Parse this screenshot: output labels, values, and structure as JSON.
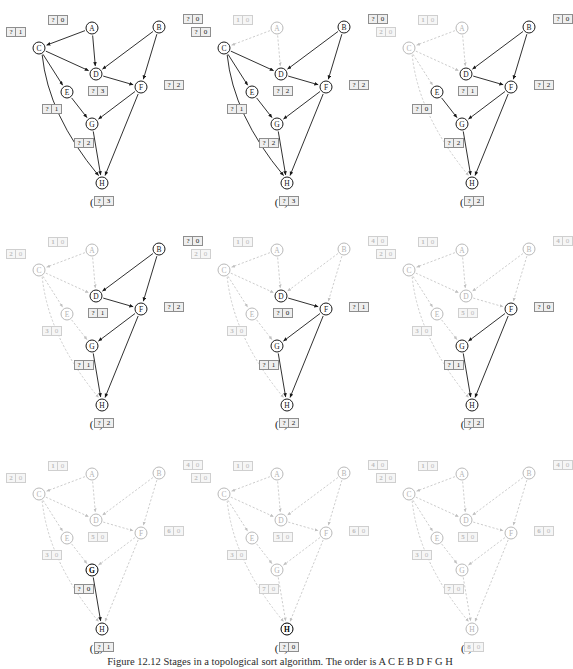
{
  "figure": {
    "caption": "Figure 12.12   Stages in a topological sort algorithm. The order is A C E B D F G H",
    "node_ids": [
      "A",
      "B",
      "C",
      "D",
      "E",
      "F",
      "G",
      "H"
    ],
    "legend": {
      "cell_left_meaning": "topological order number",
      "cell_right_meaning": "remaining in-degree",
      "unknown_symbol": "?"
    },
    "graph": {
      "nodes": [
        {
          "id": "A",
          "x": 88,
          "y": 28
        },
        {
          "id": "B",
          "x": 155,
          "y": 27
        },
        {
          "id": "C",
          "x": 35,
          "y": 48
        },
        {
          "id": "D",
          "x": 92,
          "y": 74
        },
        {
          "id": "E",
          "x": 63,
          "y": 92
        },
        {
          "id": "F",
          "x": 137,
          "y": 87
        },
        {
          "id": "G",
          "x": 88,
          "y": 124
        },
        {
          "id": "H",
          "x": 98,
          "y": 183
        }
      ],
      "edges": [
        {
          "from": "A",
          "to": "C"
        },
        {
          "from": "A",
          "to": "D"
        },
        {
          "from": "B",
          "to": "D"
        },
        {
          "from": "B",
          "to": "F"
        },
        {
          "from": "C",
          "to": "D"
        },
        {
          "from": "C",
          "to": "E"
        },
        {
          "from": "C",
          "to": "H",
          "curved": true
        },
        {
          "from": "D",
          "to": "F"
        },
        {
          "from": "E",
          "to": "G"
        },
        {
          "from": "F",
          "to": "G"
        },
        {
          "from": "F",
          "to": "H"
        },
        {
          "from": "G",
          "to": "H"
        }
      ]
    },
    "label_offsets": {
      "A": {
        "dx": -34,
        "dy": -8
      },
      "B": {
        "dx": 34,
        "dy": -8
      },
      "C": {
        "dx": -23,
        "dy": -16
      },
      "D": {
        "dx": 2,
        "dy": 17
      },
      "E": {
        "dx": -15,
        "dy": 17
      },
      "F": {
        "dx": 33,
        "dy": -2
      },
      "G": {
        "dx": -8,
        "dy": 19
      },
      "H": {
        "dx": 2,
        "dy": 18
      }
    },
    "panels": [
      {
        "id": "a",
        "caption": "(a)",
        "active_nodes": [
          "A",
          "B",
          "C",
          "D",
          "E",
          "F",
          "G",
          "H"
        ],
        "done_nodes": [],
        "highlight": [],
        "labels": {
          "A": {
            "order": "?",
            "indeg": "0"
          },
          "B": {
            "order": "?",
            "indeg": "0"
          },
          "C": {
            "order": "?",
            "indeg": "1"
          },
          "D": {
            "order": "?",
            "indeg": "3"
          },
          "E": {
            "order": "?",
            "indeg": "1"
          },
          "F": {
            "order": "?",
            "indeg": "2"
          },
          "G": {
            "order": "?",
            "indeg": "2"
          },
          "H": {
            "order": "?",
            "indeg": "3"
          }
        },
        "done_edges": []
      },
      {
        "id": "b",
        "caption": "(b)",
        "active_nodes": [
          "B",
          "C",
          "D",
          "E",
          "F",
          "G",
          "H"
        ],
        "done_nodes": [
          "A"
        ],
        "highlight": [],
        "labels": {
          "A": {
            "order": "1",
            "indeg": "0",
            "resolved": true
          },
          "B": {
            "order": "?",
            "indeg": "0"
          },
          "C": {
            "order": "?",
            "indeg": "0"
          },
          "D": {
            "order": "?",
            "indeg": "2"
          },
          "E": {
            "order": "?",
            "indeg": "1"
          },
          "F": {
            "order": "?",
            "indeg": "2"
          },
          "G": {
            "order": "?",
            "indeg": "2"
          },
          "H": {
            "order": "?",
            "indeg": "3"
          }
        },
        "done_edges": [
          "A-C",
          "A-D"
        ]
      },
      {
        "id": "c",
        "caption": "(c)",
        "active_nodes": [
          "B",
          "D",
          "E",
          "F",
          "G",
          "H"
        ],
        "done_nodes": [
          "A",
          "C"
        ],
        "highlight": [],
        "labels": {
          "A": {
            "order": "1",
            "indeg": "0",
            "resolved": true
          },
          "B": {
            "order": "?",
            "indeg": "0"
          },
          "C": {
            "order": "2",
            "indeg": "0",
            "resolved": true
          },
          "D": {
            "order": "?",
            "indeg": "1"
          },
          "E": {
            "order": "?",
            "indeg": "0"
          },
          "F": {
            "order": "?",
            "indeg": "2"
          },
          "G": {
            "order": "?",
            "indeg": "2"
          },
          "H": {
            "order": "?",
            "indeg": "2"
          }
        },
        "done_edges": [
          "A-C",
          "A-D",
          "C-D",
          "C-E",
          "C-H"
        ]
      },
      {
        "id": "d",
        "caption": "(d)",
        "active_nodes": [
          "B",
          "D",
          "F",
          "G",
          "H"
        ],
        "done_nodes": [
          "A",
          "C",
          "E"
        ],
        "highlight": [],
        "labels": {
          "A": {
            "order": "1",
            "indeg": "0",
            "resolved": true
          },
          "B": {
            "order": "?",
            "indeg": "0"
          },
          "C": {
            "order": "2",
            "indeg": "0",
            "resolved": true
          },
          "D": {
            "order": "?",
            "indeg": "1"
          },
          "E": {
            "order": "3",
            "indeg": "0",
            "resolved": true
          },
          "F": {
            "order": "?",
            "indeg": "2"
          },
          "G": {
            "order": "?",
            "indeg": "1"
          },
          "H": {
            "order": "?",
            "indeg": "2"
          }
        },
        "done_edges": [
          "A-C",
          "A-D",
          "C-D",
          "C-E",
          "C-H",
          "E-G"
        ]
      },
      {
        "id": "e",
        "caption": "(e)",
        "active_nodes": [
          "D",
          "F",
          "G",
          "H"
        ],
        "done_nodes": [
          "A",
          "B",
          "C",
          "E"
        ],
        "highlight": [],
        "labels": {
          "A": {
            "order": "1",
            "indeg": "0",
            "resolved": true
          },
          "B": {
            "order": "4",
            "indeg": "0",
            "resolved": true
          },
          "C": {
            "order": "2",
            "indeg": "0",
            "resolved": true
          },
          "D": {
            "order": "?",
            "indeg": "0"
          },
          "E": {
            "order": "3",
            "indeg": "0",
            "resolved": true
          },
          "F": {
            "order": "?",
            "indeg": "1"
          },
          "G": {
            "order": "?",
            "indeg": "1"
          },
          "H": {
            "order": "?",
            "indeg": "2"
          }
        },
        "done_edges": [
          "A-C",
          "A-D",
          "C-D",
          "C-E",
          "C-H",
          "E-G",
          "B-D",
          "B-F"
        ]
      },
      {
        "id": "f",
        "caption": "(f)",
        "active_nodes": [
          "F",
          "G",
          "H"
        ],
        "done_nodes": [
          "A",
          "B",
          "C",
          "D",
          "E"
        ],
        "highlight": [],
        "labels": {
          "A": {
            "order": "1",
            "indeg": "0",
            "resolved": true
          },
          "B": {
            "order": "4",
            "indeg": "0",
            "resolved": true
          },
          "C": {
            "order": "2",
            "indeg": "0",
            "resolved": true
          },
          "D": {
            "order": "5",
            "indeg": "0",
            "resolved": true
          },
          "E": {
            "order": "3",
            "indeg": "0",
            "resolved": true
          },
          "F": {
            "order": "?",
            "indeg": "0"
          },
          "G": {
            "order": "?",
            "indeg": "1"
          },
          "H": {
            "order": "?",
            "indeg": "2"
          }
        },
        "done_edges": [
          "A-C",
          "A-D",
          "C-D",
          "C-E",
          "C-H",
          "E-G",
          "B-D",
          "B-F",
          "D-F"
        ]
      },
      {
        "id": "g",
        "caption": "(g)",
        "active_nodes": [
          "G",
          "H"
        ],
        "done_nodes": [
          "A",
          "B",
          "C",
          "D",
          "E",
          "F"
        ],
        "highlight": [
          "G"
        ],
        "labels": {
          "A": {
            "order": "1",
            "indeg": "0",
            "resolved": true
          },
          "B": {
            "order": "4",
            "indeg": "0",
            "resolved": true
          },
          "C": {
            "order": "2",
            "indeg": "0",
            "resolved": true
          },
          "D": {
            "order": "5",
            "indeg": "0",
            "resolved": true
          },
          "E": {
            "order": "3",
            "indeg": "0",
            "resolved": true
          },
          "F": {
            "order": "6",
            "indeg": "0",
            "resolved": true
          },
          "G": {
            "order": "?",
            "indeg": "0"
          },
          "H": {
            "order": "?",
            "indeg": "1"
          }
        },
        "done_edges": [
          "A-C",
          "A-D",
          "C-D",
          "C-E",
          "C-H",
          "E-G",
          "B-D",
          "B-F",
          "D-F",
          "F-G",
          "F-H"
        ]
      },
      {
        "id": "h",
        "caption": "(h)",
        "active_nodes": [
          "H"
        ],
        "done_nodes": [
          "A",
          "B",
          "C",
          "D",
          "E",
          "F",
          "G"
        ],
        "highlight": [
          "H"
        ],
        "labels": {
          "A": {
            "order": "1",
            "indeg": "0",
            "resolved": true
          },
          "B": {
            "order": "4",
            "indeg": "0",
            "resolved": true
          },
          "C": {
            "order": "2",
            "indeg": "0",
            "resolved": true
          },
          "D": {
            "order": "5",
            "indeg": "0",
            "resolved": true
          },
          "E": {
            "order": "3",
            "indeg": "0",
            "resolved": true
          },
          "F": {
            "order": "6",
            "indeg": "0",
            "resolved": true
          },
          "G": {
            "order": "7",
            "indeg": "0",
            "resolved": true
          },
          "H": {
            "order": "?",
            "indeg": "0"
          }
        },
        "done_edges": [
          "A-C",
          "A-D",
          "C-D",
          "C-E",
          "C-H",
          "E-G",
          "B-D",
          "B-F",
          "D-F",
          "F-G",
          "F-H",
          "G-H"
        ]
      },
      {
        "id": "i",
        "caption": "(i)",
        "active_nodes": [],
        "done_nodes": [
          "A",
          "B",
          "C",
          "D",
          "E",
          "F",
          "G",
          "H"
        ],
        "highlight": [],
        "labels": {
          "A": {
            "order": "1",
            "indeg": "0",
            "resolved": true
          },
          "B": {
            "order": "4",
            "indeg": "0",
            "resolved": true
          },
          "C": {
            "order": "2",
            "indeg": "0",
            "resolved": true
          },
          "D": {
            "order": "5",
            "indeg": "0",
            "resolved": true
          },
          "E": {
            "order": "3",
            "indeg": "0",
            "resolved": true
          },
          "F": {
            "order": "6",
            "indeg": "0",
            "resolved": true
          },
          "G": {
            "order": "7",
            "indeg": "0",
            "resolved": true
          },
          "H": {
            "order": "8",
            "indeg": "0",
            "resolved": true
          }
        },
        "done_edges": [
          "A-C",
          "A-D",
          "C-D",
          "C-E",
          "C-H",
          "E-G",
          "B-D",
          "B-F",
          "D-F",
          "F-G",
          "F-H",
          "G-H"
        ]
      }
    ]
  },
  "colors": {
    "active_stroke": "#1a1a1a",
    "done_stroke": "#c0c0c0",
    "label_fill": "#efefef",
    "label_border": "#8e8e8e",
    "background": "#ffffff"
  }
}
